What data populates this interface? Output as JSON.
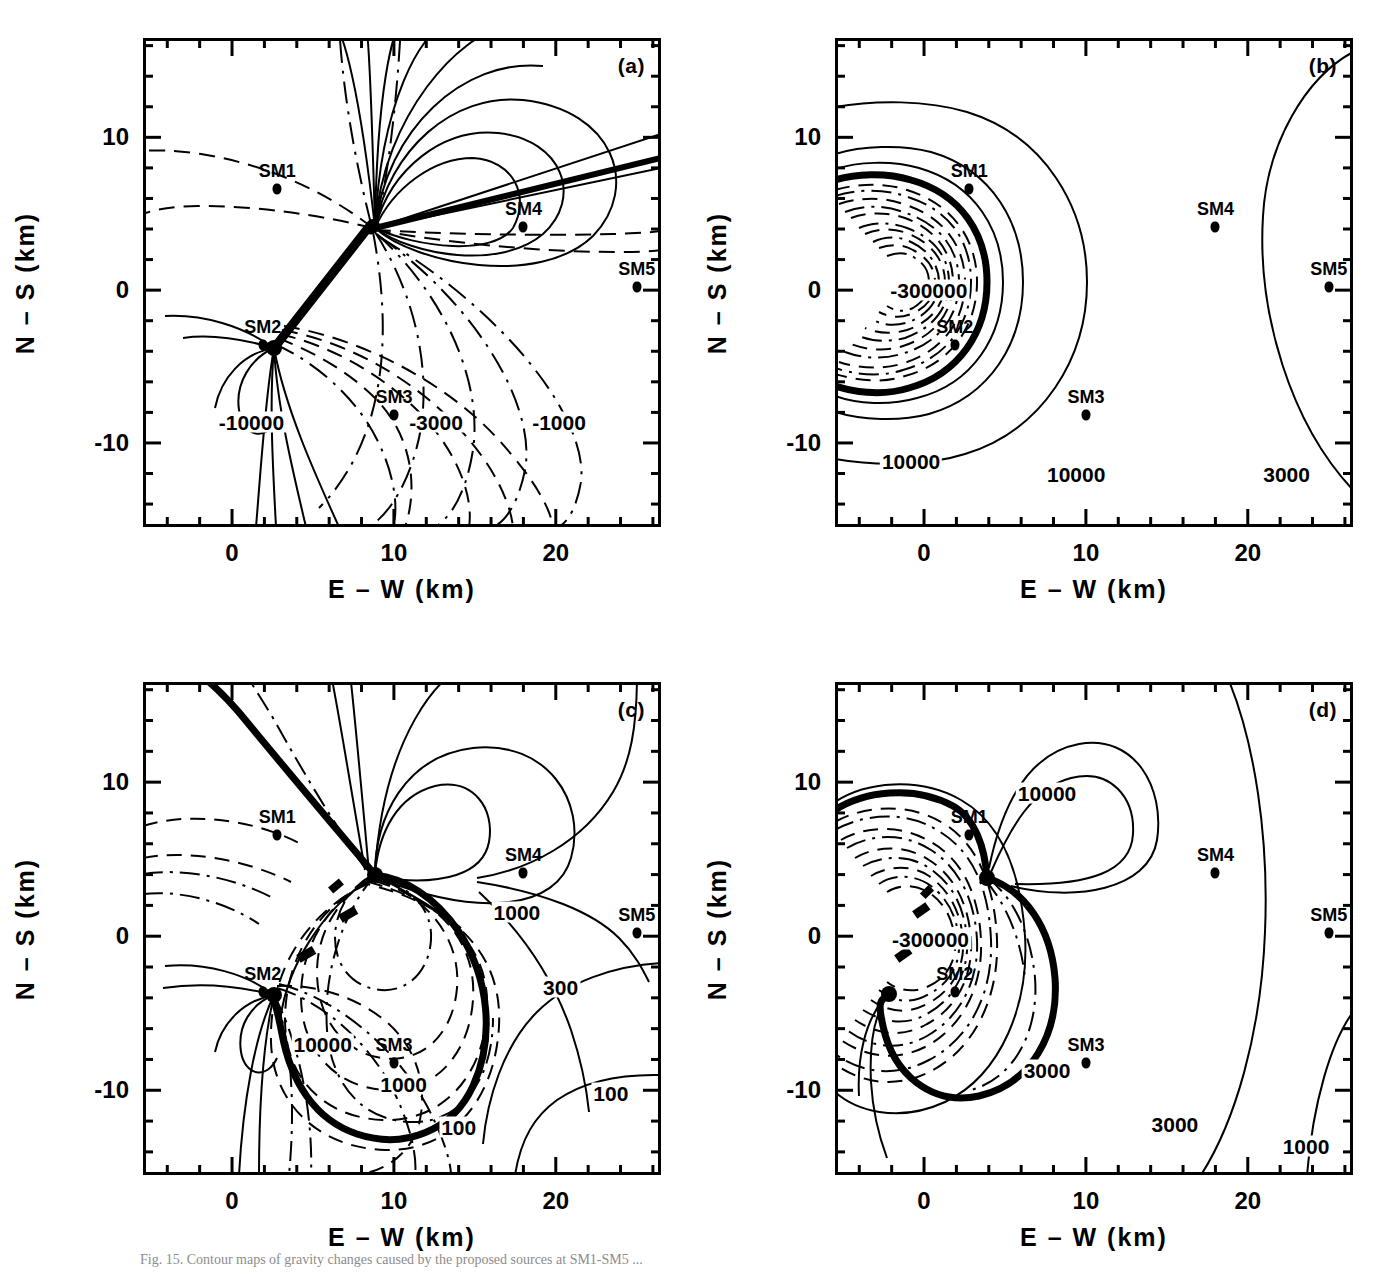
{
  "figure": {
    "caption": "Fig. 15.  Contour maps of gravity changes caused by the proposed sources at SM1-SM5 ...",
    "panel_tags": [
      "(a)",
      "(b)",
      "(c)",
      "(d)"
    ]
  },
  "axes": {
    "xlabel": "E – W (km)",
    "ylabel": "N – S (km)",
    "xticks": [
      0,
      10,
      20
    ],
    "xtick_labels": [
      "0",
      "10",
      "20"
    ],
    "yticks": [
      10,
      0,
      -10
    ],
    "ytick_labels": [
      "10",
      "0",
      "-10"
    ],
    "xlim": [
      -5.5,
      26.5
    ],
    "ylim": [
      -15.5,
      16.5
    ],
    "xminor_step": 2,
    "yminor_step": 2
  },
  "stations": [
    {
      "name": "SM1",
      "x": 2.8,
      "y": 6.6
    },
    {
      "name": "SM2",
      "x": 1.9,
      "y": -3.6
    },
    {
      "name": "SM3",
      "x": 10.0,
      "y": -8.2
    },
    {
      "name": "SM4",
      "x": 18.0,
      "y": 4.1
    },
    {
      "name": "SM5",
      "x": 25.0,
      "y": 0.2
    }
  ],
  "chart_data": {
    "type": "contour",
    "title": "",
    "xlabel": "E – W (km)",
    "ylabel": "N – S (km)",
    "xlim": [
      -5.5,
      26.5
    ],
    "ylim": [
      -15.5,
      16.5
    ],
    "grid": false,
    "legend": "none",
    "panels": [
      {
        "tag": "(a)",
        "position": "top-left",
        "contour_labels": [
          {
            "text": "-10000",
            "x": 1.2,
            "y": -8.6
          },
          {
            "text": "-3000",
            "x": 12.6,
            "y": -8.6
          },
          {
            "text": "-1000",
            "x": 20.2,
            "y": -8.6
          }
        ],
        "levels": [
          -10000,
          -3000,
          -1000
        ],
        "line_styles": [
          "solid",
          "dashed",
          "dash-dot"
        ],
        "description": "Dipolar pattern with singular source points near (3,3.5) and (-3,-3.6); positive solid lobes to upper right, negative dashed lobes to lower right."
      },
      {
        "tag": "(b)",
        "position": "top-right",
        "contour_labels": [
          {
            "text": "-300000",
            "x": 0.3,
            "y": 0.0
          },
          {
            "text": "10000",
            "x": -0.8,
            "y": -11.2
          },
          {
            "text": "10000",
            "x": 9.4,
            "y": -12.0
          },
          {
            "text": "3000",
            "x": 22.4,
            "y": -12.0
          }
        ],
        "levels": [
          -300000,
          3000,
          10000
        ],
        "line_styles": [
          "solid",
          "dashed",
          "dash-dot"
        ],
        "description": "Concentric nearly circular contours centred at (0.5,0); inner dashed negative rings to -300000, outer solid positive rings 10000 and 3000."
      },
      {
        "tag": "(c)",
        "position": "bottom-left",
        "contour_labels": [
          {
            "text": "1000",
            "x": 17.6,
            "y": 1.6
          },
          {
            "text": "300",
            "x": 20.3,
            "y": -3.3
          },
          {
            "text": "100",
            "x": 23.4,
            "y": -10.2
          },
          {
            "text": "10000",
            "x": 5.6,
            "y": -7.0
          },
          {
            "text": "1000",
            "x": 10.6,
            "y": -9.6
          },
          {
            "text": "100",
            "x": 14.0,
            "y": -12.4
          }
        ],
        "levels": [
          100,
          300,
          1000,
          10000
        ],
        "line_styles": [
          "solid",
          "dashed",
          "dash-dot"
        ],
        "description": "Asymmetric pattern with source points near (3,3.5) and (-3,-3.6); nested dashed lobes to lower right, solid outer contours sweeping to the right edge."
      },
      {
        "tag": "(d)",
        "position": "bottom-right",
        "contour_labels": [
          {
            "text": "10000",
            "x": 7.6,
            "y": 9.3
          },
          {
            "text": "-300000",
            "x": 0.4,
            "y": -0.2
          },
          {
            "text": "3000",
            "x": 7.6,
            "y": -8.7
          },
          {
            "text": "3000",
            "x": 15.5,
            "y": -12.2
          },
          {
            "text": "1000",
            "x": 23.6,
            "y": -13.6
          }
        ],
        "levels": [
          -300000,
          1000,
          3000,
          10000
        ],
        "line_styles": [
          "solid",
          "dashed",
          "dash-dot"
        ],
        "description": "Kidney-shaped nested contours centred near (0.5,0) with a lobe of 10000 to the upper right and wide solid arcs of 3000 and 1000 to the right."
      }
    ]
  }
}
